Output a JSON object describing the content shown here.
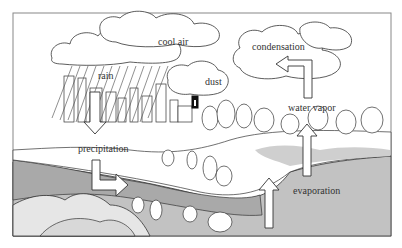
{
  "diagram": {
    "type": "water-cycle-illustration",
    "labels": {
      "cool_air": "cool air",
      "rain": "rain",
      "dust": "dust",
      "condensation": "condensation",
      "water_vapor": "water vapor",
      "precipitation": "precipitation",
      "evaporation": "evaporation"
    },
    "colors": {
      "line": "#222222",
      "frame": "#888888",
      "water": "#bdbdbd",
      "land_shade": "#d9d9d9",
      "background": "#ffffff"
    }
  }
}
